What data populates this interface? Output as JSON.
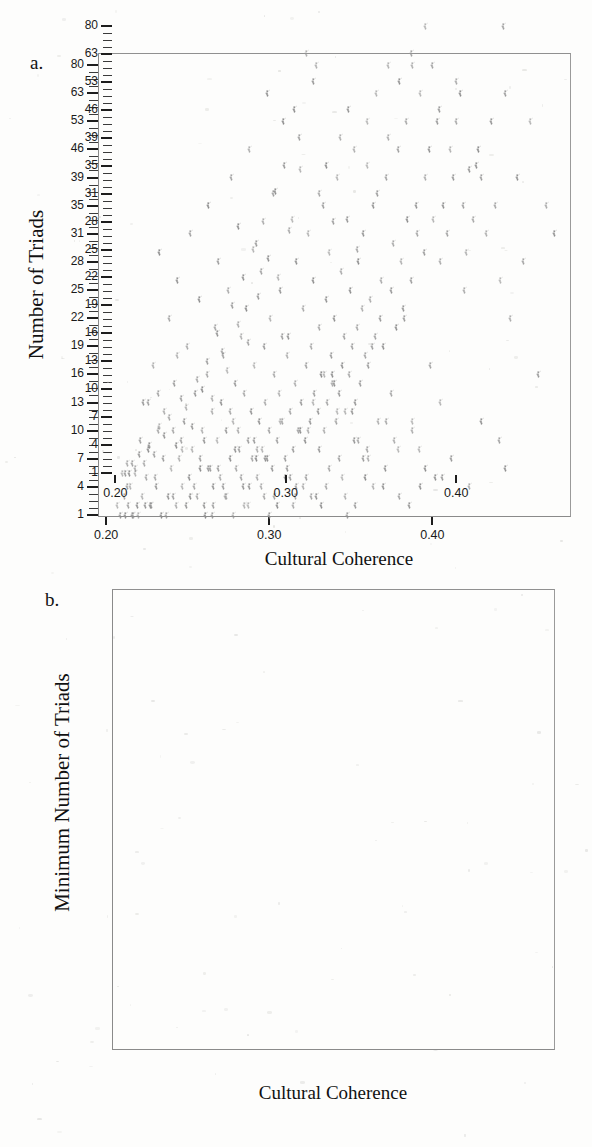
{
  "figure": {
    "panels": [
      {
        "id": "panel-a",
        "letter": "a.",
        "x_title": "Cultural Coherence",
        "y_title": "Number of Triads"
      },
      {
        "id": "panel-b",
        "letter": "b.",
        "x_title": "Cultural Coherence",
        "y_title": "Minimum Number of Triads"
      }
    ]
  },
  "chart_data": [
    {
      "type": "scatter",
      "panel": "a",
      "title": "",
      "xlabel": "Cultural Coherence",
      "ylabel": "Number of Triads",
      "xlim": [
        0.195,
        0.485
      ],
      "ylim": [
        1,
        86
      ],
      "grid": false,
      "legend": null,
      "xticks": [
        0.2,
        0.3,
        0.4
      ],
      "xtick_labels": [
        "0.20",
        "0.30",
        "0.40"
      ],
      "yticks": [
        1,
        4,
        7,
        10,
        13,
        16,
        19,
        22,
        25,
        28,
        31,
        35,
        39,
        46,
        53,
        63,
        80
      ],
      "ytick_labels": [
        "1",
        "4",
        "7",
        "10",
        "13",
        "16",
        "19",
        "22",
        "25",
        "28",
        "31",
        "35",
        "39",
        "46",
        "53",
        "63",
        "80"
      ],
      "y_scale": "nonlinear-rank",
      "marker": "small-faint-glyph",
      "marker_color": "#8d8d8d",
      "n_points": 300,
      "x": [
        0.207,
        0.209,
        0.211,
        0.212,
        0.214,
        0.215,
        0.216,
        0.218,
        0.219,
        0.221,
        0.222,
        0.223,
        0.225,
        0.226,
        0.228,
        0.229,
        0.231,
        0.232,
        0.233,
        0.235,
        0.236,
        0.238,
        0.239,
        0.24,
        0.242,
        0.243,
        0.244,
        0.246,
        0.247,
        0.248,
        0.25,
        0.251,
        0.252,
        0.253,
        0.255,
        0.256,
        0.257,
        0.258,
        0.259,
        0.26,
        0.262,
        0.263,
        0.264,
        0.265,
        0.266,
        0.267,
        0.268,
        0.269,
        0.27,
        0.271,
        0.272,
        0.273,
        0.274,
        0.275,
        0.276,
        0.277,
        0.278,
        0.279,
        0.28,
        0.281,
        0.282,
        0.283,
        0.284,
        0.285,
        0.286,
        0.287,
        0.288,
        0.289,
        0.29,
        0.291,
        0.292,
        0.293,
        0.294,
        0.295,
        0.296,
        0.297,
        0.298,
        0.299,
        0.3,
        0.301,
        0.302,
        0.303,
        0.304,
        0.305,
        0.306,
        0.307,
        0.308,
        0.309,
        0.31,
        0.311,
        0.312,
        0.313,
        0.314,
        0.315,
        0.316,
        0.317,
        0.318,
        0.319,
        0.32,
        0.321,
        0.322,
        0.323,
        0.324,
        0.325,
        0.326,
        0.327,
        0.328,
        0.329,
        0.33,
        0.331,
        0.332,
        0.333,
        0.334,
        0.335,
        0.336,
        0.337,
        0.338,
        0.339,
        0.34,
        0.341,
        0.342,
        0.343,
        0.344,
        0.345,
        0.346,
        0.347,
        0.348,
        0.349,
        0.35,
        0.351,
        0.352,
        0.353,
        0.354,
        0.355,
        0.356,
        0.357,
        0.358,
        0.359,
        0.36,
        0.361,
        0.362,
        0.364,
        0.365,
        0.366,
        0.368,
        0.369,
        0.37,
        0.372,
        0.373,
        0.375,
        0.376,
        0.378,
        0.379,
        0.381,
        0.382,
        0.384,
        0.385,
        0.387,
        0.388,
        0.39,
        0.391,
        0.393,
        0.395,
        0.396,
        0.398,
        0.4,
        0.401,
        0.403,
        0.405,
        0.407,
        0.409,
        0.411,
        0.413,
        0.415,
        0.417,
        0.419,
        0.421,
        0.423,
        0.425,
        0.428,
        0.43,
        0.433,
        0.436,
        0.439,
        0.442,
        0.445,
        0.448,
        0.452,
        0.456,
        0.46,
        0.465,
        0.47,
        0.475,
        0.213,
        0.217,
        0.224,
        0.23,
        0.234,
        0.241,
        0.245,
        0.249,
        0.254,
        0.261,
        0.269,
        0.274,
        0.279,
        0.283,
        0.287,
        0.291,
        0.295,
        0.299,
        0.303,
        0.307,
        0.311,
        0.315,
        0.319,
        0.323,
        0.327,
        0.331,
        0.335,
        0.339,
        0.343,
        0.347,
        0.351,
        0.355,
        0.359,
        0.363,
        0.367,
        0.371,
        0.375,
        0.379,
        0.383,
        0.388,
        0.393,
        0.399,
        0.405,
        0.412,
        0.42,
        0.43,
        0.441,
        0.22,
        0.227,
        0.237,
        0.252,
        0.266,
        0.278,
        0.288,
        0.297,
        0.305,
        0.313,
        0.321,
        0.329,
        0.337,
        0.345,
        0.353,
        0.361,
        0.37,
        0.38,
        0.392,
        0.406,
        0.423,
        0.445,
        0.265,
        0.285,
        0.3,
        0.316,
        0.332,
        0.348,
        0.364,
        0.386,
        0.241,
        0.258,
        0.272,
        0.293,
        0.31,
        0.326,
        0.342,
        0.358,
        0.377,
        0.402,
        0.232,
        0.247,
        0.263,
        0.281,
        0.298,
        0.317,
        0.334,
        0.352,
        0.372,
        0.396,
        0.226,
        0.244,
        0.26,
        0.276,
        0.292,
        0.308,
        0.324,
        0.34,
        0.36,
        0.388
      ],
      "y": [
        2,
        1,
        3,
        1,
        2,
        4,
        1,
        6,
        2,
        9,
        3,
        13,
        5,
        8,
        2,
        17,
        4,
        10,
        29,
        7,
        12,
        3,
        22,
        6,
        15,
        2,
        26,
        9,
        4,
        11,
        19,
        5,
        31,
        8,
        14,
        3,
        24,
        7,
        10,
        2,
        16,
        35,
        6,
        12,
        4,
        21,
        9,
        28,
        5,
        13,
        18,
        3,
        10,
        25,
        7,
        39,
        11,
        15,
        6,
        32,
        8,
        20,
        4,
        14,
        23,
        9,
        46,
        12,
        7,
        17,
        30,
        5,
        11,
        27,
        8,
        19,
        13,
        63,
        10,
        22,
        6,
        16,
        37,
        9,
        14,
        25,
        11,
        53,
        7,
        18,
        20,
        12,
        33,
        8,
        15,
        28,
        10,
        41,
        13,
        23,
        9,
        17,
        31,
        11,
        19,
        26,
        14,
        80,
        12,
        21,
        16,
        35,
        10,
        24,
        13,
        29,
        18,
        15,
        22,
        11,
        39,
        14,
        27,
        17,
        20,
        12,
        33,
        16,
        25,
        19,
        46,
        13,
        21,
        28,
        15,
        23,
        31,
        18,
        53,
        17,
        24,
        35,
        20,
        63,
        22,
        26,
        19,
        39,
        80,
        25,
        30,
        21,
        46,
        28,
        23,
        53,
        33,
        26,
        80,
        35,
        31,
        63,
        29,
        39,
        46,
        80,
        33,
        53,
        28,
        35,
        31,
        46,
        39,
        53,
        63,
        35,
        29,
        41,
        33,
        46,
        39,
        31,
        53,
        35,
        26,
        63,
        22,
        39,
        28,
        53,
        16,
        35,
        31,
        4,
        1,
        2,
        5,
        1,
        3,
        7,
        2,
        4,
        1,
        6,
        3,
        8,
        5,
        2,
        9,
        4,
        7,
        3,
        11,
        6,
        2,
        10,
        5,
        13,
        8,
        4,
        16,
        7,
        3,
        12,
        9,
        5,
        19,
        11,
        6,
        14,
        8,
        22,
        10,
        4,
        17,
        13,
        7,
        25,
        11,
        9,
        1,
        2,
        1,
        3,
        2,
        1,
        4,
        3,
        2,
        5,
        4,
        3,
        6,
        5,
        2,
        7,
        4,
        3,
        8,
        5,
        4,
        6,
        1,
        2,
        1,
        3,
        2,
        1,
        4,
        2,
        10,
        6,
        4,
        8,
        5,
        3,
        12,
        7,
        9,
        5,
        14,
        8,
        6,
        10,
        7,
        4,
        16,
        9,
        11,
        6,
        13,
        18,
        9,
        12,
        7,
        20,
        10,
        15,
        8,
        11
      ]
    },
    {
      "type": "scatter",
      "panel": "b",
      "title": "",
      "xlabel": "Cultural Coherence",
      "ylabel": "Minimum Number of Triads",
      "xlim": [
        0.198,
        0.458
      ],
      "ylim": [
        1,
        86
      ],
      "grid": false,
      "legend": null,
      "xticks": [
        0.2,
        0.3,
        0.4
      ],
      "xtick_labels": [
        "0.20",
        "0.30",
        "0.40"
      ],
      "yticks": [
        1,
        4,
        7,
        10,
        13,
        16,
        19,
        22,
        25,
        28,
        31,
        35,
        39,
        46,
        53,
        63,
        80
      ],
      "ytick_labels": [
        "1",
        "4",
        "7",
        "10",
        "13",
        "16",
        "19",
        "22",
        "25",
        "28",
        "31",
        "35",
        "39",
        "46",
        "53",
        "63",
        "80"
      ],
      "y_scale": "nonlinear-rank",
      "marker": "small-faint-glyph",
      "marker_color": "#8d8d8d",
      "n_points": 56,
      "x": [
        0.204,
        0.206,
        0.207,
        0.208,
        0.21,
        0.212,
        0.214,
        0.217,
        0.22,
        0.223,
        0.226,
        0.229,
        0.232,
        0.236,
        0.239,
        0.242,
        0.245,
        0.248,
        0.251,
        0.254,
        0.257,
        0.26,
        0.263,
        0.266,
        0.269,
        0.272,
        0.275,
        0.278,
        0.281,
        0.284,
        0.287,
        0.29,
        0.293,
        0.296,
        0.299,
        0.302,
        0.305,
        0.308,
        0.312,
        0.316,
        0.32,
        0.324,
        0.328,
        0.332,
        0.337,
        0.342,
        0.348,
        0.354,
        0.36,
        0.367,
        0.374,
        0.382,
        0.39,
        0.4,
        0.412,
        0.428
      ],
      "y": [
        1,
        1,
        2,
        1,
        2,
        1,
        3,
        2,
        4,
        3,
        6,
        5,
        7,
        4,
        9,
        8,
        6,
        11,
        10,
        13,
        9,
        16,
        14,
        12,
        19,
        17,
        22,
        15,
        25,
        20,
        28,
        24,
        31,
        22,
        35,
        27,
        46,
        39,
        63,
        53,
        31,
        35,
        28,
        39,
        46,
        25,
        35,
        31,
        39,
        53,
        63,
        80,
        46,
        53,
        35,
        80
      ]
    }
  ]
}
